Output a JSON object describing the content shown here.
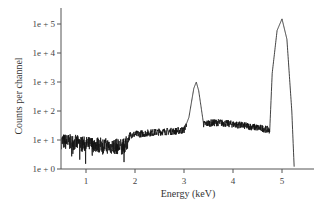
{
  "chart_data": {
    "type": "line",
    "title": "",
    "xlabel": "Energy (keV)",
    "ylabel": "Counts per channel",
    "yscale": "log",
    "xlim": [
      0.5,
      5.65
    ],
    "ylim": [
      1,
      1000000
    ],
    "grid": false,
    "legend": null,
    "x_ticks": [
      1,
      2,
      3,
      4,
      5
    ],
    "x_tick_labels": [
      "1",
      "2",
      "3",
      "4",
      "5"
    ],
    "y_ticks": [
      1,
      10,
      100,
      1000,
      10000,
      100000
    ],
    "y_tick_labels": [
      "1e + 0",
      "1e + 1",
      "1e + 2",
      "1e + 3",
      "1e + 4",
      "1e + 5"
    ],
    "series": [
      {
        "name": "spectrum",
        "description": "Noisy low-energy continuum (~8 counts 0.5-1.8 keV, ~15-20 counts 1.8-3.0 keV), peak at ~3.25 keV (~1e3 counts), plateau ~30-40 counts from 3.4-4.7 keV, dominant peak at ~5.0 keV (~1.5e5 counts), falling to ~1 count by ~5.25 keV",
        "x": [
          0.5,
          0.8,
          1.0,
          1.2,
          1.5,
          1.8,
          1.9,
          2.2,
          2.5,
          2.8,
          3.0,
          3.1,
          3.2,
          3.25,
          3.3,
          3.4,
          3.5,
          3.7,
          4.0,
          4.3,
          4.6,
          4.75,
          4.8,
          4.9,
          5.0,
          5.1,
          5.2,
          5.25
        ],
        "y": [
          9,
          8,
          7,
          7,
          6,
          6,
          15,
          17,
          19,
          20,
          22,
          60,
          600,
          1000,
          500,
          35,
          38,
          40,
          35,
          30,
          25,
          22,
          2000,
          60000,
          150000,
          30000,
          100,
          1
        ]
      }
    ],
    "peaks": [
      {
        "energy_keV": 3.25,
        "counts": 1000
      },
      {
        "energy_keV": 5.0,
        "counts": 150000
      }
    ]
  }
}
